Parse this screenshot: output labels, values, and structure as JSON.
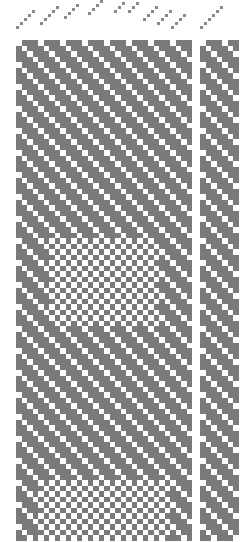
{
  "colors": {
    "dark": "#7a7a7a",
    "light": "#ffffff",
    "thread": "#8a8a8a"
  },
  "cell_size": 5.5,
  "threading": {
    "groups": [
      {
        "x0": 16,
        "y0": 26,
        "steps": 5
      },
      {
        "x0": 40,
        "y0": 22,
        "steps": 5
      },
      {
        "x0": 64,
        "y0": 16,
        "steps": 4
      },
      {
        "x0": 88,
        "y0": 12,
        "steps": 4
      },
      {
        "x0": 114,
        "y0": 10,
        "steps": 3
      },
      {
        "x0": 128,
        "y0": 10,
        "steps": 3
      },
      {
        "x0": 143,
        "y0": 18,
        "steps": 4
      },
      {
        "x0": 157,
        "y0": 22,
        "steps": 4
      },
      {
        "x0": 171,
        "y0": 26,
        "steps": 4
      },
      {
        "x0": 200,
        "y0": 26,
        "steps": 6
      }
    ],
    "step_dx": 4,
    "step_dy": -4
  },
  "blocks": [
    {
      "name": "main-drawdown",
      "x": 16,
      "y": 40,
      "cols": 32,
      "rows": 91
    },
    {
      "name": "side-drawdown",
      "x": 200,
      "y": 40,
      "cols": 7,
      "rows": 91
    }
  ],
  "pattern": {
    "twill_period": 4,
    "checker_zones": [
      {
        "row_start": 36,
        "row_end": 52,
        "col_start": 6,
        "col_end": 26
      },
      {
        "row_start": 80,
        "row_end": 91,
        "col_start": 4,
        "col_end": 28
      }
    ]
  }
}
